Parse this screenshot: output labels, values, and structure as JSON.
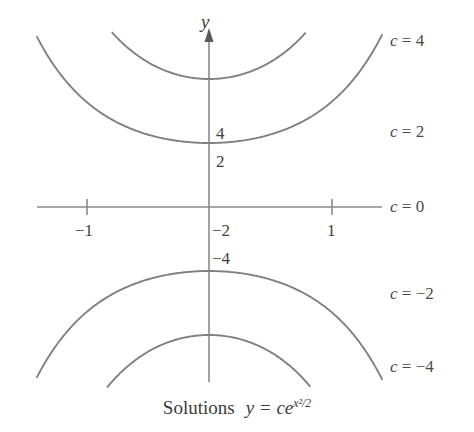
{
  "figure": {
    "caption_word": "Solutions",
    "caption_formula_base": "y = ce",
    "caption_formula_exponent": "x²/2",
    "axis_y_name": "y",
    "background_color": "#ffffff",
    "curve_color": "#808080",
    "axis_color": "#8a8a8a",
    "text_color": "#3f3f3f"
  },
  "chart_data": {
    "type": "line",
    "xlabel": "",
    "ylabel": "y",
    "xlim": [
      -1.4,
      1.4
    ],
    "ylim": [
      -7.2,
      7.2
    ],
    "grid": false,
    "legend_position": "right-inline",
    "equation": "y = ce^(x^2/2)",
    "x_ticks": [
      -1,
      1
    ],
    "x_tick_labels": [
      "−1",
      "1"
    ],
    "y_ticks": [
      4,
      2,
      -2,
      -4
    ],
    "y_tick_labels": [
      "4",
      "2",
      "−2",
      "−4"
    ],
    "series": [
      {
        "name": "c = 4",
        "c": 4,
        "label": "c = 4",
        "label_c": "c",
        "label_eq": "=",
        "label_value": "4",
        "y_intercept": 4
      },
      {
        "name": "c = 2",
        "c": 2,
        "label": "c = 2",
        "label_c": "c",
        "label_eq": "=",
        "label_value": "2",
        "y_intercept": 2
      },
      {
        "name": "c = 0",
        "c": 0,
        "label": "c = 0",
        "label_c": "c",
        "label_eq": "=",
        "label_value": "0",
        "y_intercept": 0
      },
      {
        "name": "c = -2",
        "c": -2,
        "label": "c = −2",
        "label_c": "c",
        "label_eq": "=",
        "label_value": "−2",
        "y_intercept": -2
      },
      {
        "name": "c = -4",
        "c": -4,
        "label": "c = −4",
        "label_c": "c",
        "label_eq": "=",
        "label_value": "−4",
        "y_intercept": -4
      }
    ]
  }
}
